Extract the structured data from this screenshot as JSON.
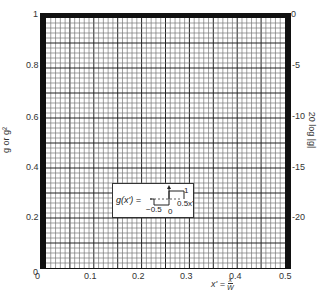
{
  "chart_data": {
    "type": "line",
    "title": "",
    "xlabel": "x' = x / W",
    "ylabel_left": "g or g²",
    "ylabel_right": "20 log |g|",
    "xlim": [
      0,
      0.5
    ],
    "ylim_left": [
      0,
      1
    ],
    "ylim_right_db": [
      0,
      -25
    ],
    "x_ticks": [
      "0",
      "0.1",
      "0.2",
      "0.3",
      "0.4",
      "0.5"
    ],
    "y_left_ticks": [
      "0",
      "0.2",
      "0.4",
      "0.6",
      "0.8",
      "1"
    ],
    "y_right_ticks": [
      "0",
      "-5",
      "-10",
      "-15",
      "-20"
    ],
    "grid": {
      "on": true,
      "minor_x_step": 0.01,
      "minor_y_step": 0.02,
      "major_every": 5
    },
    "series": [],
    "inset": {
      "equation_lhs": "g(x') =",
      "description": "Rectangular pulse: value 1 for 0 < x' < 0.5, 0 for -0.5 < x' < 0 (dashed baseline)",
      "labels": [
        "1",
        "-0.5",
        "0",
        "0.5",
        "x'"
      ]
    }
  },
  "axes": {
    "x_ticks": [
      "0",
      "0.1",
      "0.2",
      "0.3",
      "0.4",
      "0.5"
    ],
    "y_left_ticks": [
      "0",
      "0.2",
      "0.4",
      "0.6",
      "0.8",
      "1"
    ],
    "y_right_ticks": [
      "0",
      "-5",
      "-10",
      "-15",
      "-20"
    ],
    "y_left_label": "g or g²",
    "y_right_label": "20 log |g|",
    "x_label_lhs": "x' =",
    "x_label_num": "x",
    "x_label_den": "W"
  },
  "inset": {
    "equation": "g(x') =",
    "one": "1",
    "neg_half": "−0.5",
    "zero": "0",
    "half_x": "0.5x'"
  }
}
